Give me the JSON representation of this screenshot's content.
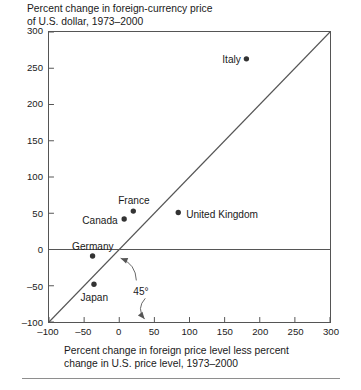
{
  "figure": {
    "title": "Percent change in foreign-currency price\nof U.S. dollar, 1973–2000",
    "axis_caption": "Percent change in foreign price level less percent\nchange in U.S. price level, 1973–2000",
    "angle_annotation": "45°"
  },
  "chart_data": {
    "type": "scatter",
    "title": "Percent change in foreign-currency price of U.S. dollar, 1973–2000",
    "xlabel": "Percent change in foreign price level less percent change in U.S. price level, 1973–2000",
    "ylabel": "Percent change in foreign-currency price of U.S. dollar, 1973–2000",
    "xlim": [
      -100,
      300
    ],
    "ylim": [
      -100,
      300
    ],
    "xticks": [
      -100,
      -50,
      0,
      50,
      100,
      150,
      200,
      250,
      300
    ],
    "yticks": [
      -100,
      -50,
      0,
      50,
      100,
      150,
      200,
      250,
      300
    ],
    "xtick_labels": [
      "–100",
      "–50",
      "0",
      "50",
      "100",
      "150",
      "200",
      "250",
      "300"
    ],
    "ytick_labels": [
      "–100",
      "–50",
      "0",
      "50",
      "100",
      "150",
      "200",
      "250",
      "300"
    ],
    "grid": false,
    "legend": "none",
    "reference_lines": [
      {
        "name": "45-degree-line",
        "type": "diagonal",
        "from": [
          -100,
          -100
        ],
        "to": [
          300,
          300
        ],
        "annotation": "45°"
      },
      {
        "name": "zero-line",
        "type": "horizontal",
        "y": 0
      }
    ],
    "points": [
      {
        "label": "Italy",
        "x": 181,
        "y": 263,
        "label_position": "right"
      },
      {
        "label": "United Kingdom",
        "x": 84,
        "y": 51,
        "label_position": "left"
      },
      {
        "label": "France",
        "x": 20,
        "y": 53,
        "label_position": "above"
      },
      {
        "label": "Canada",
        "x": 7,
        "y": 42,
        "label_position": "right"
      },
      {
        "label": "Germany",
        "x": -38,
        "y": -9,
        "label_position": "above"
      },
      {
        "label": "Japan",
        "x": -36,
        "y": -48,
        "label_position": "below"
      }
    ]
  },
  "colors": {
    "point": "#333333",
    "frame": "#555555",
    "line": "#555555",
    "text": "#1a1a1a",
    "rule": "#8e8e8e"
  }
}
